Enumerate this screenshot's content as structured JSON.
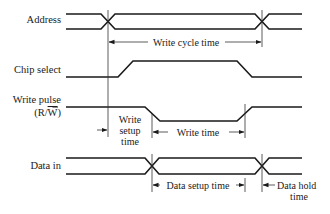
{
  "diagram": {
    "type": "timing-diagram",
    "signals": [
      {
        "id": "address",
        "label": "Address"
      },
      {
        "id": "chip_select",
        "label": "Chip select"
      },
      {
        "id": "write_pulse",
        "label": "Write pulse",
        "sublabel_prefix": "(R/",
        "sublabel_overline": "W",
        "sublabel_suffix": ")"
      },
      {
        "id": "data_in",
        "label": "Data in"
      }
    ],
    "annotations": {
      "write_cycle_time": "Write cycle time",
      "write_setup_time": [
        "Write",
        "setup",
        "time"
      ],
      "write_time": "Write time",
      "data_setup_time": "Data setup time",
      "data_hold_time": [
        "Data hold",
        "time"
      ]
    },
    "colors": {
      "line": "#1a1a1a",
      "background": "#ffffff"
    }
  }
}
